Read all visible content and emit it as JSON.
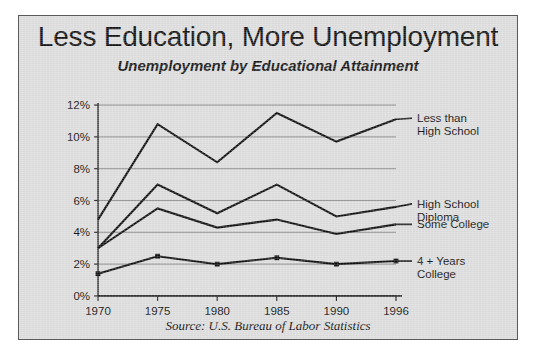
{
  "figure": {
    "title": "Less Education, More Unemployment",
    "subtitle": "Unemployment by Educational Attainment",
    "source": "Source:  U.S. Bureau of Labor Statistics",
    "background_color": "#dedede",
    "border_color": "#5a5a5a",
    "line_color": "#111111"
  },
  "chart_data": {
    "type": "line",
    "title": "Less Education, More Unemployment",
    "subtitle": "Unemployment by Educational Attainment",
    "xlabel": "",
    "ylabel": "",
    "categories": [
      "1970",
      "1975",
      "1980",
      "1985",
      "1990",
      "1996"
    ],
    "x": [
      1970,
      1975,
      1980,
      1985,
      1990,
      1996
    ],
    "ylim": [
      0,
      12
    ],
    "xlim": [
      1970,
      1996
    ],
    "ytick_labels": [
      "0%",
      "2%",
      "4%",
      "6%",
      "8%",
      "10%",
      "12%"
    ],
    "yticks": [
      0,
      2,
      4,
      6,
      8,
      10,
      12
    ],
    "grid": true,
    "legend_position": "right-inline",
    "unit": "percent",
    "series": [
      {
        "name": "Less than High School",
        "label_lines": [
          "Less than",
          "High School"
        ],
        "values": [
          4.8,
          10.8,
          8.4,
          11.5,
          9.7,
          11.1
        ]
      },
      {
        "name": "High School Diploma",
        "label_lines": [
          "High School",
          "Diploma"
        ],
        "values": [
          3.0,
          7.0,
          5.2,
          7.0,
          5.0,
          5.6
        ]
      },
      {
        "name": "Some College",
        "label_lines": [
          "Some College"
        ],
        "values": [
          3.0,
          5.5,
          4.3,
          4.8,
          3.9,
          4.5
        ]
      },
      {
        "name": "4 + Years College",
        "label_lines": [
          "4 + Years",
          "College"
        ],
        "values": [
          1.4,
          2.5,
          2.0,
          2.4,
          2.0,
          2.2
        ]
      }
    ],
    "annotations": [
      "Source:  U.S. Bureau of Labor Statistics"
    ]
  }
}
